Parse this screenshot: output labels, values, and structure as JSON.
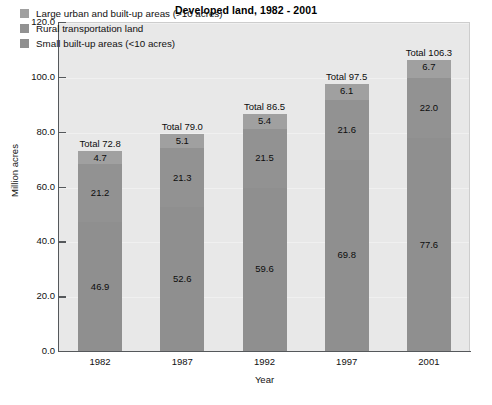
{
  "chart_data": {
    "type": "bar",
    "subtype": "stacked-vertical",
    "title": "Developed land, 1982 - 2001",
    "xlabel": "Year",
    "ylabel": "Million acres",
    "categories": [
      "1982",
      "1987",
      "1992",
      "1997",
      "2001"
    ],
    "ylim": [
      0.0,
      120.0
    ],
    "yticks": [
      "0.0",
      "20.0",
      "40.0",
      "60.0",
      "80.0",
      "100.0",
      "120.0"
    ],
    "ytick_values": [
      0.0,
      20.0,
      40.0,
      60.0,
      80.0,
      100.0,
      120.0
    ],
    "grid": true,
    "legend_position": "upper-left-inside",
    "series": [
      {
        "name": "Small built-up areas (<10 acres)",
        "stack_order": 0,
        "color": "#8f8f8f",
        "values": [
          46.9,
          52.6,
          59.6,
          69.8,
          77.6
        ],
        "labels": [
          "46.9",
          "52.6",
          "59.6",
          "69.8",
          "77.6"
        ]
      },
      {
        "name": "Rural transportation land",
        "stack_order": 1,
        "color": "#929292",
        "values": [
          21.2,
          21.3,
          21.5,
          21.6,
          22.0
        ],
        "labels": [
          "21.2",
          "21.3",
          "21.5",
          "21.6",
          "22.0"
        ]
      },
      {
        "name": "Large urban and built-up areas (>10 acres)",
        "stack_order": 2,
        "color": "#a0a0a0",
        "values": [
          4.7,
          5.1,
          5.4,
          6.1,
          6.7
        ],
        "labels": [
          "4.7",
          "5.1",
          "5.4",
          "6.1",
          "6.7"
        ]
      }
    ],
    "totals": [
      72.8,
      79.0,
      86.5,
      97.5,
      106.3
    ],
    "total_labels": [
      "Total 72.8",
      "Total 79.0",
      "Total 86.5",
      "Total 97.5",
      "Total 106.3"
    ]
  },
  "legend": {
    "items": [
      {
        "label": "Large urban and built-up areas (>10 acres)",
        "color": "#a0a0a0"
      },
      {
        "label": "Rural transportation land",
        "color": "#929292"
      },
      {
        "label": "Small built-up areas (<10 acres)",
        "color": "#8f8f8f"
      }
    ]
  },
  "axes": {
    "y_title": "Million acres",
    "x_title": "Year"
  },
  "colors": {
    "plot_background": "#e8e8e8",
    "page_background": "#ffffff",
    "axis": "#55585b",
    "text": "#111111",
    "gridline": "#f0f0f0"
  }
}
